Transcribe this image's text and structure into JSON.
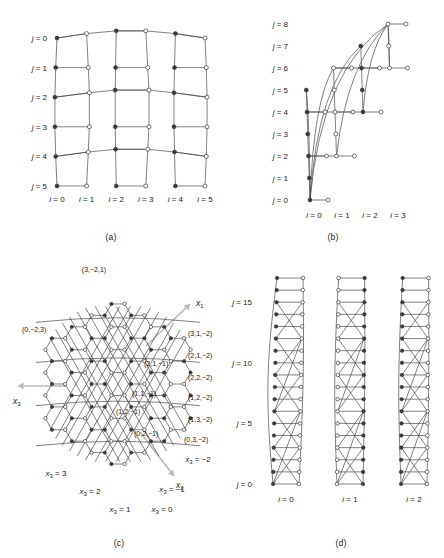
{
  "figure": {
    "panels": [
      {
        "id": "a",
        "caption": "(a)",
        "type": "rectangular-lattice",
        "row_label_prefix": "j",
        "col_label_prefix": "i",
        "row_labels": [
          "j = 0",
          "j = 1",
          "j = 2",
          "j = 3",
          "j = 4",
          "j = 5"
        ],
        "col_labels": [
          "i = 0",
          "i = 1",
          "i = 2",
          "i = 3",
          "i = 4",
          "i = 5"
        ],
        "rows": 6,
        "cols": 6,
        "row_values": [
          0,
          1,
          2,
          3,
          4,
          5
        ],
        "col_values": [
          0,
          1,
          2,
          3,
          4,
          5
        ]
      },
      {
        "id": "b",
        "caption": "(b)",
        "type": "staircase-lattice",
        "row_label_prefix": "j",
        "col_label_prefix": "i",
        "row_labels": [
          "j = 0",
          "j = 1",
          "j = 2",
          "j = 3",
          "j = 4",
          "j = 5",
          "j = 6",
          "j = 7",
          "j = 8"
        ],
        "col_labels": [
          "i = 0",
          "i = 1",
          "i = 2",
          "i = 3"
        ],
        "rows": 9,
        "cols": 4,
        "row_values": [
          0,
          1,
          2,
          3,
          4,
          5,
          6,
          7,
          8
        ],
        "col_values": [
          0,
          1,
          2,
          3
        ],
        "column_row_starts": [
          0,
          2,
          4,
          6
        ],
        "column_row_ends": [
          5,
          6,
          7,
          8
        ]
      },
      {
        "id": "c",
        "caption": "(c)",
        "type": "honeycomb-lattice",
        "axis_names": [
          "x1",
          "x2",
          "x3"
        ],
        "axis_labels": [
          {
            "name": "x",
            "sub": "1"
          },
          {
            "name": "x",
            "sub": "2"
          },
          {
            "name": "x",
            "sub": "3"
          }
        ],
        "coordinate_labels": [
          "(3,−2,1)",
          "(0,−2,3)",
          "(3,1,−2)",
          "(2,1,−2)",
          "(2,1,−1)",
          "(2,2,−2)",
          "(1,1,−1)",
          "(1,2,−2)",
          "(1,2,−1)",
          "(1,3,−2)",
          "(0,2,−1)",
          "(0,3,−2)"
        ],
        "x3_level_labels": [
          "x3 = 3",
          "x3 = 2",
          "x3 = 1",
          "x3 = 0",
          "x3 = −1",
          "x3 = −2"
        ],
        "x3_levels": [
          {
            "var": "x",
            "sub": "3",
            "value": "3"
          },
          {
            "var": "x",
            "sub": "3",
            "value": "2"
          },
          {
            "var": "x",
            "sub": "3",
            "value": "1"
          },
          {
            "var": "x",
            "sub": "3",
            "value": "0"
          },
          {
            "var": "x",
            "sub": "3",
            "value": "−1"
          },
          {
            "var": "x",
            "sub": "3",
            "value": "−2"
          }
        ]
      },
      {
        "id": "d",
        "caption": "(d)",
        "type": "three-column-lattice",
        "row_label_prefix": "j",
        "col_label_prefix": "i",
        "row_labels": [
          "j = 0",
          "j = 5",
          "j = 10",
          "j = 15"
        ],
        "row_label_values": [
          0,
          5,
          10,
          15
        ],
        "col_labels": [
          "i = 0",
          "i = 1",
          "i = 2"
        ],
        "col_values": [
          0,
          1,
          2
        ],
        "rows": 18,
        "cols": 3
      }
    ],
    "colors": {
      "edge": "#4a4a4a",
      "node_filled": "#3a3a3a",
      "node_open": "#ffffff",
      "axis_arrow": "#b9b9b9",
      "text": "#1a1a1a",
      "background": "#ffffff"
    }
  }
}
